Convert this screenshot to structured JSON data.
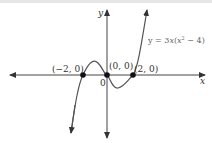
{
  "diagram": {
    "axes": {
      "x_label": "x",
      "y_label": "y",
      "origin_label": "0"
    },
    "equation": {
      "prefix": "y = 3",
      "var": "x",
      "paren": "(",
      "var2": "x",
      "exp": "2",
      "suffix": " − 4)"
    },
    "points": [
      {
        "label": "(−2, 0)",
        "x": -2,
        "y": 0
      },
      {
        "label": "(0, 0)",
        "x": 0,
        "y": 0
      },
      {
        "label": "(2, 0)",
        "x": 2,
        "y": 0
      }
    ],
    "colors": {
      "axis": "#444444",
      "curve": "#555555",
      "point": "#111111"
    }
  }
}
